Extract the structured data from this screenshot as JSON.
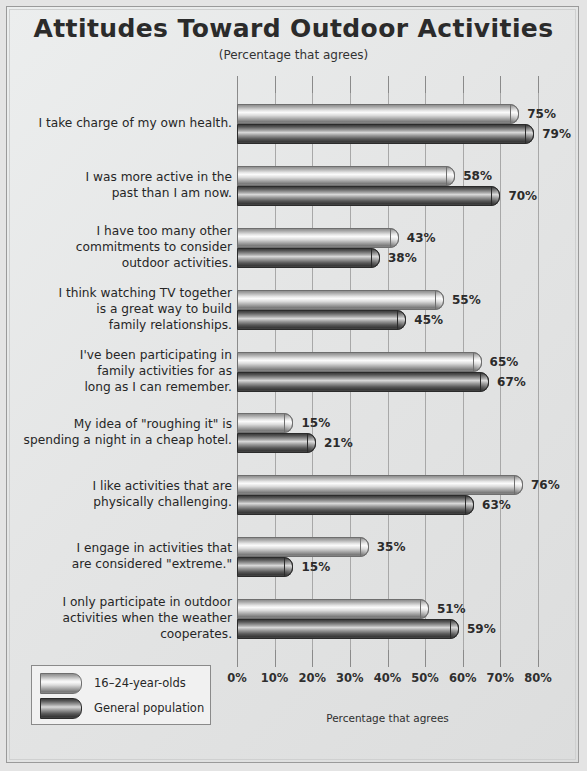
{
  "title": "Attitudes Toward Outdoor Activities",
  "subtitle": "(Percentage that agrees)",
  "legend": {
    "items": [
      {
        "label": "16–24-year-olds",
        "style": "light"
      },
      {
        "label": "General population",
        "style": "dark"
      }
    ]
  },
  "chart_data": {
    "type": "bar",
    "orientation": "horizontal",
    "title": "Attitudes Toward Outdoor Activities",
    "subtitle": "(Percentage that agrees)",
    "xlabel": "Percentage that agrees",
    "ylabel": "",
    "xlim": [
      0,
      80
    ],
    "xticks": [
      0,
      10,
      20,
      30,
      40,
      50,
      60,
      70,
      80
    ],
    "xticklabels": [
      "0%",
      "10%",
      "20%",
      "30%",
      "40%",
      "50%",
      "60%",
      "70%",
      "80%"
    ],
    "grid": true,
    "legend_position": "bottom-left",
    "categories": [
      "I take charge of my own health.",
      "I was more active in the past than I am now.",
      "I have too many other commitments to consider outdoor activities.",
      "I think watching TV together is a great way to build family relationships.",
      "I've been participating in family activities for as long as I can remember.",
      "My idea of \"roughing it\" is spending a night in a cheap hotel.",
      "I like activities that are physically challenging.",
      "I engage in activities that are considered \"extreme.\"",
      "I only participate in  outdoor activities when the weather cooperates."
    ],
    "category_lines": [
      [
        "I take charge of my own health."
      ],
      [
        "I was more active in the",
        "past than I am now."
      ],
      [
        "I have too many other",
        "commitments to consider",
        "outdoor activities."
      ],
      [
        "I think watching TV together",
        "is a great way to build",
        "family relationships."
      ],
      [
        "I've been participating in",
        "family activities for as",
        "long as I can remember."
      ],
      [
        "My idea of \"roughing it\" is",
        "spending a night in a cheap hotel."
      ],
      [
        "I like activities that are",
        "physically challenging."
      ],
      [
        "I engage in activities that",
        "are considered \"extreme.\""
      ],
      [
        "I only participate in  outdoor",
        "activities when the weather",
        "cooperates."
      ]
    ],
    "series": [
      {
        "name": "16–24-year-olds",
        "style": "light",
        "values": [
          75,
          58,
          43,
          55,
          65,
          15,
          76,
          35,
          51
        ],
        "value_labels": [
          "75%",
          "58%",
          "43%",
          "55%",
          "65%",
          "15%",
          "76%",
          "35%",
          "51%"
        ]
      },
      {
        "name": "General population",
        "style": "dark",
        "values": [
          79,
          70,
          38,
          45,
          67,
          21,
          63,
          15,
          59
        ],
        "value_labels": [
          "79%",
          "70%",
          "38%",
          "45%",
          "67%",
          "21%",
          "63%",
          "15%",
          "59%"
        ]
      }
    ]
  },
  "colors": {
    "background": "#e4e5e5",
    "bar_light": "#d8d8d8",
    "bar_dark": "#4a4a4a",
    "grid": "#a8a8a8",
    "text": "#262626"
  }
}
